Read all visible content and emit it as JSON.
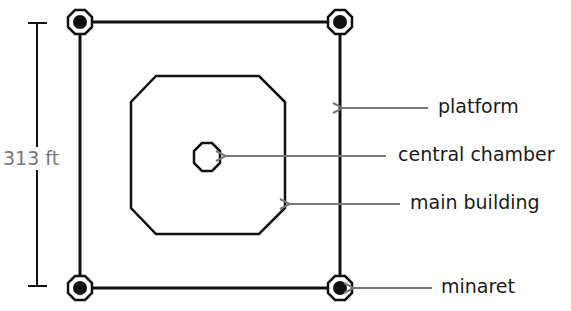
{
  "diagram": {
    "type": "floor-plan",
    "dimension": {
      "label": "313 ft",
      "color": "#777777"
    },
    "labels": {
      "platform": "platform",
      "central_chamber": "central chamber",
      "main_building": "main building",
      "minaret": "minaret"
    },
    "colors": {
      "outline": "#111111",
      "arrow": "#777777",
      "text": "#1a1a1a"
    },
    "elements": [
      {
        "name": "platform",
        "shape": "square"
      },
      {
        "name": "main building",
        "shape": "octagon"
      },
      {
        "name": "central chamber",
        "shape": "octagon"
      },
      {
        "name": "minaret",
        "shape": "circle-in-octagon",
        "count": 4
      }
    ]
  }
}
